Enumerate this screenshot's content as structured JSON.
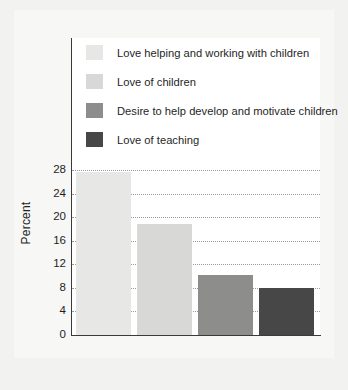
{
  "chart_data": {
    "type": "bar",
    "title": "",
    "subtitle": "",
    "xlabel": "",
    "ylabel": "Percent",
    "ylim": [
      0,
      28
    ],
    "yticks": [
      0,
      4,
      8,
      12,
      16,
      20,
      24,
      28
    ],
    "grid": true,
    "legend_position": "top-inside",
    "categories": [
      "Love helping and working with children",
      "Love of children",
      "Desire to help develop and motivate children",
      "Love of teaching"
    ],
    "values": [
      27.6,
      18.9,
      10.2,
      7.9
    ],
    "colors": [
      "#e7e7e5",
      "#d8d8d6",
      "#8d8d8b",
      "#474747"
    ],
    "series": [
      {
        "name": "Percent",
        "values": [
          27.6,
          18.9,
          10.2,
          7.9
        ]
      }
    ],
    "legend": [
      {
        "label": "Love helping and working with children",
        "color": "#e7e7e5"
      },
      {
        "label": "Love of children",
        "color": "#d8d8d6"
      },
      {
        "label": "Desire to help develop and motivate children",
        "color": "#8d8d8b"
      },
      {
        "label": "Love of teaching",
        "color": "#474747"
      }
    ]
  },
  "axis": {
    "y_label": "Percent",
    "tick_labels": [
      "28",
      "24",
      "20",
      "16",
      "12",
      "8",
      "4",
      "0"
    ]
  },
  "colors": {
    "page_background": "#f2f2f0",
    "card_background": "#f7f7f6",
    "plot_background": "#ffffff",
    "axis_line": "#3a3a3a",
    "gridline": "#9a9a98",
    "text": "#1f1f1f"
  }
}
